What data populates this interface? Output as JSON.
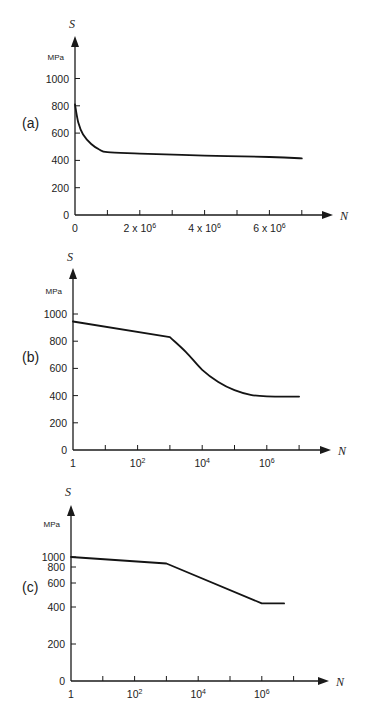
{
  "chart_data": [
    {
      "type": "line",
      "panel_label": "(a)",
      "title": "",
      "ylabel": "S",
      "yunit": "MPa",
      "xlabel": "N",
      "xscale": "linear",
      "yscale": "linear",
      "xlim": [
        0,
        7500000
      ],
      "ylim": [
        0,
        1150
      ],
      "yticks": [
        0,
        200,
        400,
        600,
        800,
        1000
      ],
      "ytick_labels": [
        "0",
        "200",
        "400",
        "600",
        "800",
        "1000"
      ],
      "xticks": [
        0,
        1000000,
        2000000,
        3000000,
        4000000,
        5000000,
        6000000,
        7000000
      ],
      "xtick_labels": [
        {
          "value": 0,
          "base": "0",
          "exp": ""
        },
        {
          "value": 2000000,
          "base": "2 x 10",
          "exp": "6"
        },
        {
          "value": 4000000,
          "base": "4 x 10",
          "exp": "6"
        },
        {
          "value": 6000000,
          "base": "6 x 10",
          "exp": "6"
        }
      ],
      "grid": false,
      "series": [
        {
          "name": "S-N curve (a)",
          "x": [
            0,
            100000,
            250000,
            500000,
            750000,
            1000000,
            2000000,
            4000000,
            6000000,
            7000000
          ],
          "y": [
            810,
            680,
            590,
            520,
            480,
            460,
            450,
            435,
            425,
            415
          ]
        }
      ]
    },
    {
      "type": "line",
      "panel_label": "(b)",
      "title": "",
      "ylabel": "S",
      "yunit": "MPa",
      "xlabel": "N",
      "xscale": "log",
      "yscale": "linear",
      "xlim_log10": [
        0,
        8
      ],
      "ylim": [
        0,
        1150
      ],
      "yticks": [
        0,
        200,
        400,
        600,
        800,
        1000
      ],
      "ytick_labels": [
        "0",
        "200",
        "400",
        "600",
        "800",
        "1000"
      ],
      "xticks_log10": [
        0,
        1,
        2,
        3,
        4,
        5,
        6,
        7
      ],
      "xtick_labels": [
        {
          "log10": 0,
          "base": "1",
          "exp": ""
        },
        {
          "log10": 2,
          "base": "10",
          "exp": "2"
        },
        {
          "log10": 4,
          "base": "10",
          "exp": "4"
        },
        {
          "log10": 6,
          "base": "10",
          "exp": "6"
        }
      ],
      "grid": false,
      "series": [
        {
          "name": "S-N curve (b)",
          "log10_x": [
            0,
            3.0,
            3.5,
            4.0,
            4.5,
            5.0,
            5.5,
            6.0,
            7.0
          ],
          "y": [
            945,
            830,
            720,
            590,
            500,
            440,
            405,
            395,
            393
          ]
        }
      ]
    },
    {
      "type": "line",
      "panel_label": "(c)",
      "title": "",
      "ylabel": "S",
      "yunit": "MPa",
      "xlabel": "N",
      "xscale": "log",
      "yscale": "log",
      "xlim_log10": [
        0,
        8
      ],
      "yticks": [
        0,
        200,
        400,
        600,
        800,
        1000
      ],
      "ytick_labels": [
        "0",
        "200",
        "400",
        "600",
        "800",
        "1000"
      ],
      "ytick_pixel_y": [
        681,
        644,
        607,
        583,
        567,
        557
      ],
      "xticks_log10": [
        0,
        1,
        2,
        3,
        4,
        5,
        6,
        7
      ],
      "xtick_labels": [
        {
          "log10": 0,
          "base": "1",
          "exp": ""
        },
        {
          "log10": 2,
          "base": "10",
          "exp": "2"
        },
        {
          "log10": 4,
          "base": "10",
          "exp": "4"
        },
        {
          "log10": 6,
          "base": "10",
          "exp": "6"
        }
      ],
      "grid": false,
      "series": [
        {
          "name": "S-N curve (c)",
          "log10_x": [
            0,
            3.0,
            6.0,
            6.7
          ],
          "y": [
            1000,
            870,
            430,
            430
          ]
        }
      ]
    }
  ],
  "layout": [
    {
      "ox": 75,
      "oy": 215,
      "axis_top": 36,
      "x_end": 333,
      "x_step": 32.4,
      "y_per_unit": 0.1365,
      "panel_x": 22,
      "panel_y": 128,
      "s_y": 28,
      "mpa_y": 60,
      "n_x": 340
    },
    {
      "ox": 73,
      "oy": 450,
      "axis_top": 268,
      "x_end": 331,
      "x_step": 32.3,
      "y_per_unit": 0.136,
      "panel_x": 22,
      "panel_y": 362,
      "s_y": 261,
      "mpa_y": 294,
      "n_x": 338
    },
    {
      "ox": 71,
      "oy": 681,
      "axis_top": 505,
      "x_end": 329,
      "x_step": 31.8,
      "y_per_unit": 0,
      "panel_x": 22,
      "panel_y": 592,
      "s_y": 496,
      "mpa_y": 527,
      "n_x": 336
    }
  ]
}
